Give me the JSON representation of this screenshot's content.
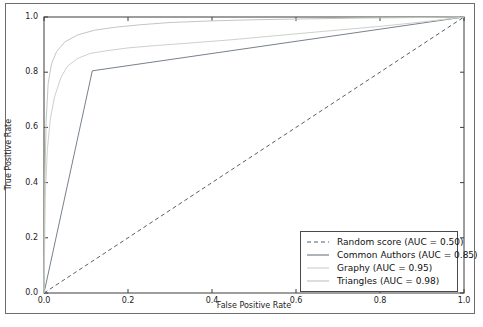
{
  "figure": {
    "background": "#ffffff",
    "outer_border_color": "#6e6e6e",
    "axes_color": "#3d3d3d",
    "text_color": "#1c1c1c"
  },
  "chart_data": {
    "type": "line",
    "title": "",
    "xlabel": "False Positive Rate",
    "ylabel": "True Positive Rate",
    "xlim": [
      0.0,
      1.0
    ],
    "ylim": [
      0.0,
      1.0
    ],
    "xticks": [
      0.0,
      0.2,
      0.4,
      0.6,
      0.8,
      1.0
    ],
    "yticks": [
      0.0,
      0.2,
      0.4,
      0.6,
      0.8,
      1.0
    ],
    "grid": false,
    "legend_position": "lower right",
    "series": [
      {
        "name": "Random score (AUC = 0.50)",
        "auc": 0.5,
        "color": "#55606e",
        "dash": "4,3",
        "x": [
          0,
          1
        ],
        "y": [
          0,
          1
        ]
      },
      {
        "name": "Common Authors (AUC = 0.85)",
        "auc": 0.85,
        "color": "#78818c",
        "dash": null,
        "x": [
          0,
          0.115,
          1
        ],
        "y": [
          0,
          0.805,
          1
        ]
      },
      {
        "name": "Graphy (AUC = 0.95)",
        "auc": 0.95,
        "color": "#cdd2ca",
        "dash": null,
        "x": [
          0,
          0.003,
          0.008,
          0.015,
          0.025,
          0.04,
          0.055,
          0.08,
          0.11,
          0.15,
          0.2,
          0.27,
          0.35,
          0.45,
          0.55,
          0.68,
          0.8,
          0.9,
          1
        ],
        "y": [
          0,
          0.35,
          0.52,
          0.63,
          0.71,
          0.78,
          0.82,
          0.85,
          0.868,
          0.878,
          0.888,
          0.897,
          0.906,
          0.918,
          0.932,
          0.95,
          0.966,
          0.982,
          1
        ]
      },
      {
        "name": "Triangles (AUC = 0.98)",
        "auc": 0.98,
        "color": "#c1c8bd",
        "dash": null,
        "x": [
          0,
          0.002,
          0.005,
          0.01,
          0.018,
          0.03,
          0.05,
          0.08,
          0.12,
          0.17,
          0.23,
          0.3,
          0.4,
          0.5,
          0.62,
          0.75,
          0.88,
          1
        ],
        "y": [
          0,
          0.4,
          0.62,
          0.76,
          0.83,
          0.875,
          0.91,
          0.935,
          0.952,
          0.963,
          0.972,
          0.98,
          0.986,
          0.99,
          0.993,
          0.996,
          0.998,
          1
        ]
      }
    ]
  }
}
